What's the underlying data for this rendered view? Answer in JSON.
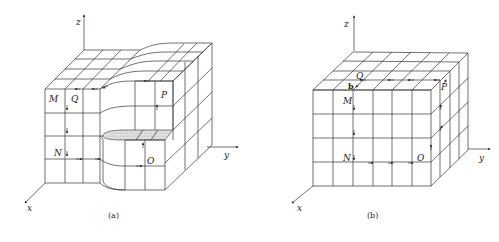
{
  "figures": [
    {
      "id": "a",
      "caption": "(a)",
      "axes": {
        "x": "x",
        "y": "y",
        "z": "z"
      },
      "points": {
        "M": "M",
        "Q": "Q",
        "P": "P",
        "N": "N",
        "O": "O"
      },
      "description": "Grid block with a curved notch removed; shaded cut surface at the step"
    },
    {
      "id": "b",
      "caption": "(b)",
      "axes": {
        "x": "x",
        "y": "y",
        "z": "z"
      },
      "points": {
        "Q": "Q",
        "b": "b",
        "M": "M",
        "P": "P",
        "N": "N",
        "O": "O"
      },
      "description": "Full rectangular grid cube, 6 columns x 4 rows front face"
    }
  ],
  "colors": {
    "line": "#333333",
    "shade": "#bdbdbd",
    "background": "#ffffff"
  }
}
